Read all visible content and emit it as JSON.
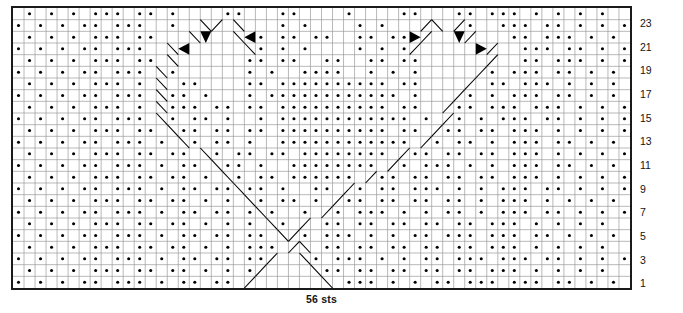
{
  "chart": {
    "caption": "56 sts",
    "columns": 56,
    "rows": 24,
    "cell_width": 11.0893,
    "cell_height": 11.8333,
    "colors": {
      "grid_line": "#9a9a9a",
      "border": "#1a1a1a",
      "symbol": "#000000",
      "background": "#ffffff",
      "text": "#141414"
    },
    "row_numbers": [
      {
        "row": 23,
        "label": "23"
      },
      {
        "row": 21,
        "label": "21"
      },
      {
        "row": 19,
        "label": "19"
      },
      {
        "row": 17,
        "label": "17"
      },
      {
        "row": 15,
        "label": "15"
      },
      {
        "row": 13,
        "label": "13"
      },
      {
        "row": 11,
        "label": "11"
      },
      {
        "row": 9,
        "label": "9"
      },
      {
        "row": 7,
        "label": "7"
      },
      {
        "row": 5,
        "label": "5"
      },
      {
        "row": 3,
        "label": "3"
      },
      {
        "row": 1,
        "label": "1"
      }
    ],
    "legend": {
      "dot": "purl-stitch",
      "blank": "knit-stitch",
      "diag_up": "travel-right-diagonal",
      "diag_dn": "travel-left-diagonal",
      "tri_dn_l": "decrease-left-triangle",
      "tri_dn_r": "decrease-right-triangle",
      "tri_up_l": "increase-left-triangle",
      "tri_up_r": "increase-right-triangle"
    },
    "note": "cells[] is indexed from row 24 (top) down to row 1 (bottom); each string has 56 characters, one per stitch column left-to-right. Legend: '.'=purl dot, ' '=plain knit, '/'=diagonal rising left-to-right, '\\'=diagonal falling left-to-right, '<'=black triangle pointing left, '>'=black triangle pointing right, 'v'=black triangle pointing down, '^'=black triangle pointing up",
    "cells": [
      " . . . ... .. .    ..   ..    .    ..   .. ... . . . .  ",
      ". . . .. ...  .  \\/ \\   . .    . .   /\\ /.  ... .. . . .",
      " . . . ... ..   \\v  \\<. .. ..  .. ..>/  v/   .. ... . . .",
      ". . . .. ...  \\<     \\. . .    . . ./     >/  ... .. . . ",
      " . . . ... .. \\      .. ..  ..  .. ..      /  .. ... . . ",
      ". . . .. ... \\.      . .  ....  . . .     /. ... .. . . .",
      " . . . ... . \\ ..    .. .......... ..    / .. ... . . . .",
      ". . . .. ... \\.. .   . ............ .   /. . ... .. . . .",
      " . . . ... . \\... .. .. .......... ..  /.. ... ... . . . ",
      ". . . .. ... \\. .. .  . ............ . /. . ... .. . . . ",
      " . . . ... .. \\.. .. .. .......... .. /.. .. ... . . . . ",
      ". . . .. ... . \\. .. .  ............ /. .. . ... .. . . .",
      " . . . ... .. .. \\. .. .. ........ /.. .. .. ... . . . . ",
      ". . . .. ... . .. \\.. .  ........ /. ... . . ... .. . . .",
      " . . . ... .. .. . \\. .. ...... /.. .. .. .. ... . . . . ",
      ". . . .. ... . .. ..\\.. .  .. /. .. ... . . ... .. . . . ",
      " . . . ... .. .. . . \\. .. . /.. .. .. .. . ... . . . .  ",
      ". . . .. ... . .. .. .\\.  . /. ... . . .. . ... .. . . . ",
      " . . . ... .. .. . . . \\. / .. .. .. .. .. ... . . . .  .",
      ". . . .. ... . .. .. .. \\/. ... . . .. ... ... .. . . . .",
      " . . . ... .. .. . . ... /\\ .. .. .. .. .. ... . . . .  .",
      ". . . .. ... . .. .. ../  \\. ... . . .. ... ... .. . . . ",
      " . . . ... .. .. . . ./    \\.. .. .. .. .. ... . . . .  .",
      ". . . .. ... . .. .. /      \\ ... . . .. ... ... .. . . ."
    ]
  }
}
